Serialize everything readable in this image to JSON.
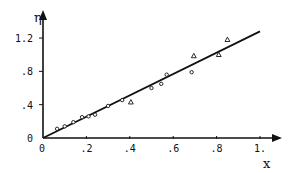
{
  "chart_data": {
    "type": "scatter",
    "title": "",
    "xlabel": "x",
    "ylabel": "η",
    "xlim": [
      0,
      1.0
    ],
    "ylim": [
      0,
      1.3
    ],
    "grid": false,
    "legend": null,
    "x_ticks": [
      {
        "value": 0,
        "label": "0"
      },
      {
        "value": 0.2,
        "label": ".2"
      },
      {
        "value": 0.4,
        "label": ".4"
      },
      {
        "value": 0.6,
        "label": ".6"
      },
      {
        "value": 0.8,
        "label": ".8"
      },
      {
        "value": 1.0,
        "label": "1."
      }
    ],
    "y_ticks": [
      {
        "value": 0,
        "label": "0"
      },
      {
        "value": 0.4,
        "label": ".4"
      },
      {
        "value": 0.8,
        "label": ".8"
      },
      {
        "value": 1.2,
        "label": "1.2"
      }
    ],
    "fit_line": {
      "x": [
        0,
        1.0
      ],
      "y": [
        0,
        1.28
      ],
      "slope": 1.28
    },
    "series": [
      {
        "name": "circles",
        "marker": "circle",
        "points": [
          [
            0.065,
            0.11
          ],
          [
            0.1,
            0.14
          ],
          [
            0.14,
            0.19
          ],
          [
            0.18,
            0.25
          ],
          [
            0.21,
            0.26
          ],
          [
            0.24,
            0.28
          ],
          [
            0.3,
            0.385
          ],
          [
            0.365,
            0.455
          ],
          [
            0.5,
            0.6
          ],
          [
            0.545,
            0.65
          ],
          [
            0.57,
            0.76
          ],
          [
            0.685,
            0.79
          ]
        ]
      },
      {
        "name": "triangles",
        "marker": "triangle",
        "points": [
          [
            0.405,
            0.43
          ],
          [
            0.695,
            0.985
          ],
          [
            0.81,
            1.0
          ],
          [
            0.85,
            1.18
          ]
        ]
      }
    ]
  },
  "plot_geometry": {
    "origin_px": [
      43,
      138
    ],
    "px_per_x": 217,
    "px_per_y": 83.3,
    "x_axis_end_px": 282,
    "y_axis_top_px": 10
  },
  "colors": {
    "ink": "#111111",
    "background": "#ffffff"
  }
}
